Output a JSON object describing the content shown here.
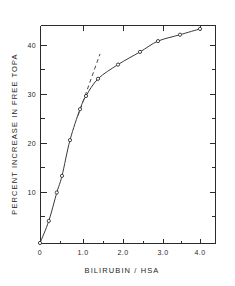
{
  "chart_data": {
    "type": "line",
    "title": "",
    "subtitle": "",
    "xlabel": "BILIRUBIN / HSA",
    "ylabel": "PERCENT INCREASE IN FREE TOPA",
    "xlim": [
      0,
      4.4
    ],
    "ylim": [
      0,
      44.5
    ],
    "grid": false,
    "legend": "none",
    "x_ticks_major": [
      "0",
      "1.0",
      "2.0",
      "3.0",
      "4.0"
    ],
    "x_tick_values_major": [
      0,
      1.0,
      2.0,
      3.0,
      4.0
    ],
    "x_tick_values_minor": [
      0.5,
      1.5,
      2.5,
      3.5
    ],
    "y_ticks_major": [
      "10",
      "20",
      "30",
      "40"
    ],
    "y_tick_values_major": [
      10,
      20,
      30,
      40
    ],
    "y_tick_values_minor": [
      5,
      15,
      25,
      35
    ],
    "series": [
      {
        "name": "percent increase in free TOPA",
        "marker": "open-circle",
        "line": "solid",
        "x": [
          0,
          0.22,
          0.42,
          0.55,
          0.75,
          1.0,
          1.15,
          1.45,
          1.95,
          2.5,
          2.95,
          3.5,
          4.0
        ],
        "y": [
          0,
          4.5,
          10.3,
          13.7,
          21.0,
          27.3,
          30.0,
          33.5,
          36.4,
          39.0,
          41.2,
          42.5,
          43.7
        ]
      },
      {
        "name": "initial-slope tangent",
        "marker": "none",
        "line": "dashed",
        "x": [
          0.95,
          1.5
        ],
        "y": [
          26.0,
          38.6
        ]
      }
    ],
    "annotations": []
  },
  "figure": {
    "axis_title_x": "BILIRUBIN / HSA",
    "axis_title_y": "PERCENT INCREASE IN FREE TOPA"
  }
}
